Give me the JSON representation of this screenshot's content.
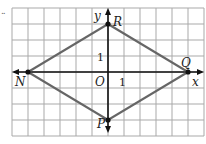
{
  "figure": {
    "marker": "..",
    "grid": {
      "cols": 12,
      "rows": 8,
      "cell_px": 16,
      "left": 12,
      "top": 8,
      "color": "#a9a9a9"
    },
    "origin_px": {
      "x": 108,
      "y": 72
    },
    "axis_labels": {
      "x": "x",
      "y": "y",
      "origin": "O"
    },
    "ticks": {
      "x_one": "1",
      "y_one": "1"
    },
    "points": [
      {
        "name": "R",
        "x": 0,
        "y": 3
      },
      {
        "name": "Q",
        "x": 5,
        "y": 0
      },
      {
        "name": "P",
        "x": 0,
        "y": -3
      },
      {
        "name": "N",
        "x": -5,
        "y": 0
      }
    ],
    "shape": "rhombus NRQP",
    "line_color": "#666666",
    "axis_color": "#111111"
  }
}
